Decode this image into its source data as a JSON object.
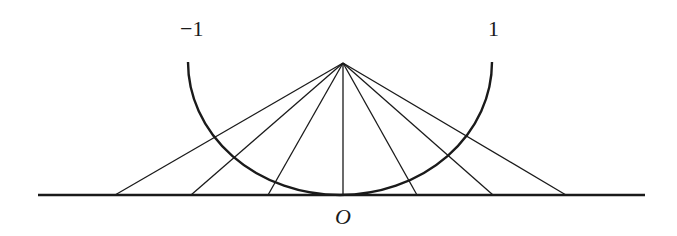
{
  "diagram": {
    "labels": {
      "left_endpoint": "−1",
      "right_endpoint": "1",
      "origin": "O"
    },
    "colors": {
      "stroke": "#1a1a1a",
      "background": "#ffffff"
    },
    "geometry": {
      "apex": [
        343,
        63
      ],
      "semicircle": {
        "cx": 340,
        "cy": 62,
        "rx": 152,
        "ry": 133
      },
      "baseline": {
        "y": 195,
        "x1": 38,
        "x2": 645
      },
      "ray_feet_x": [
        115,
        191,
        268,
        343,
        417,
        493,
        566
      ]
    }
  }
}
